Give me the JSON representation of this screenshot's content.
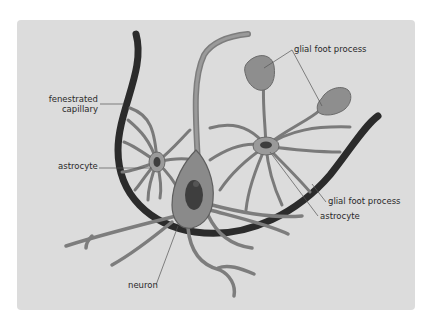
{
  "diagram": {
    "type": "neurovascular unit illustration",
    "background_color": "#dcdcdc",
    "colors": {
      "capillary": "#2b2b2b",
      "cell_fill": "#8e8e8e",
      "cell_stroke": "#5a5a5a",
      "nucleus": "#3e3e3e",
      "leader_line": "#555555",
      "text": "#2a2a2a"
    },
    "labels": {
      "fenestrated_capillary_line1": "fenestrated",
      "fenestrated_capillary_line2": "capillary",
      "astrocyte_left": "astrocyte",
      "glial_foot_process_top": "glial foot process",
      "glial_foot_process_right": "glial foot process",
      "astrocyte_right": "astrocyte",
      "neuron": "neuron"
    }
  }
}
